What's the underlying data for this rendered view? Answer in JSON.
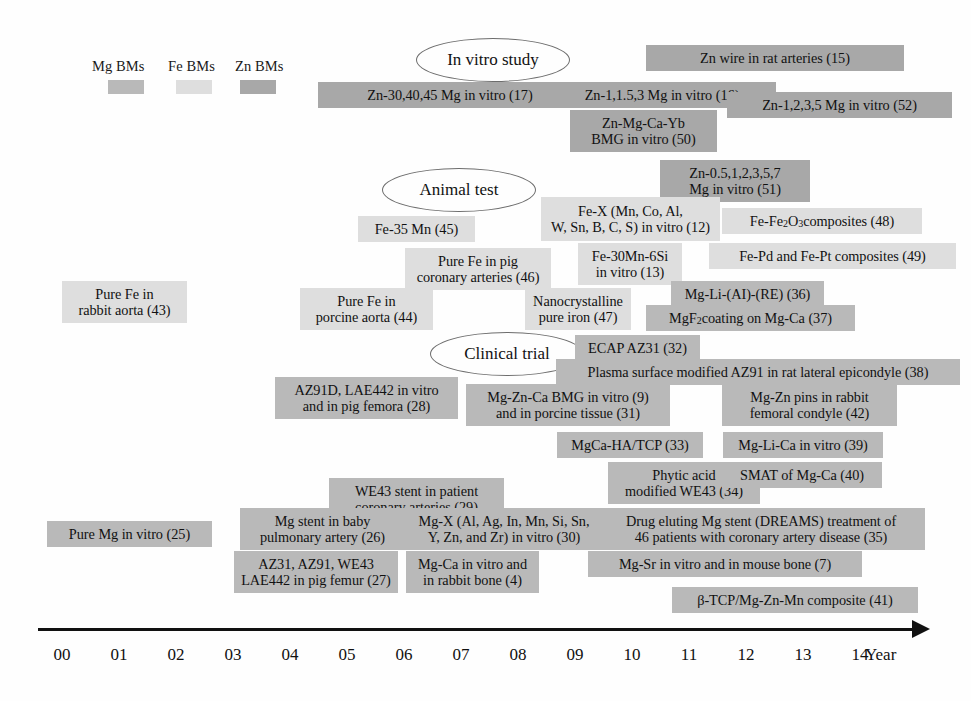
{
  "figure": {
    "type": "timeline",
    "title_present": false,
    "axis": {
      "label": "Year",
      "ticks": [
        "00",
        "01",
        "02",
        "03",
        "04",
        "05",
        "06",
        "07",
        "08",
        "09",
        "10",
        "11",
        "12",
        "13",
        "14"
      ],
      "x_positions": [
        62,
        119,
        176,
        233,
        290,
        347,
        404,
        461,
        518,
        575,
        632,
        689,
        746,
        803,
        860
      ]
    },
    "legend": {
      "items": [
        {
          "label": "Mg BMs",
          "color": "#b9b9b9",
          "key": "mg"
        },
        {
          "label": "Fe BMs",
          "color": "#dedede",
          "key": "fe"
        },
        {
          "label": "Zn BMs",
          "color": "#a8a8a8",
          "key": "zn"
        }
      ]
    },
    "categories": [
      {
        "label": "In vitro study",
        "x": 416,
        "y": 38,
        "w": 152,
        "h": 42
      },
      {
        "label": "Animal test",
        "x": 382,
        "y": 168,
        "w": 152,
        "h": 42
      },
      {
        "label": "Clinical trial",
        "x": 430,
        "y": 332,
        "w": 152,
        "h": 42
      }
    ],
    "events": [
      {
        "id": 15,
        "label": "Zn wire in rat arteries (15)",
        "group": "zn",
        "x": 646,
        "y": 45,
        "w": 258,
        "h": 26
      },
      {
        "id": 17,
        "label": "Zn-30,40,45 Mg in vitro (17)",
        "group": "zn",
        "x": 318,
        "y": 82,
        "w": 264,
        "h": 26
      },
      {
        "id": 16,
        "label": "Zn-1,1.5,3 Mg in vitro (16)",
        "group": "zn",
        "x": 548,
        "y": 82,
        "w": 228,
        "h": 26
      },
      {
        "id": 52,
        "label": "Zn-1,2,3,5 Mg in vitro (52)",
        "group": "zn",
        "x": 727,
        "y": 92,
        "w": 225,
        "h": 26
      },
      {
        "id": 50,
        "label": "Zn-Mg-Ca-Yb\nBMG in vitro (50)",
        "group": "zn",
        "x": 570,
        "y": 110,
        "w": 147,
        "h": 42
      },
      {
        "id": 51,
        "label": "Zn-0.5,1,2,3,5,7\nMg in vitro (51)",
        "group": "zn",
        "x": 660,
        "y": 160,
        "w": 150,
        "h": 42
      },
      {
        "id": 12,
        "label": "Fe-X (Mn, Co, Al,\nW, Sn, B, C, S) in vitro (12)",
        "group": "fe",
        "x": 541,
        "y": 197,
        "w": 179,
        "h": 44
      },
      {
        "id": 48,
        "label": "Fe-Fe2O3 composites (48)",
        "label_html": "Fe-Fe<sub>2</sub>O<sub>3</sub> composites (48)",
        "group": "fe",
        "x": 722,
        "y": 208,
        "w": 200,
        "h": 26
      },
      {
        "id": 45,
        "label": "Fe-35 Mn (45)",
        "group": "fe",
        "x": 358,
        "y": 216,
        "w": 117,
        "h": 26
      },
      {
        "id": 13,
        "label": "Fe-30Mn-6Si\nin vitro (13)",
        "group": "fe",
        "x": 578,
        "y": 243,
        "w": 104,
        "h": 42
      },
      {
        "id": 49,
        "label": "Fe-Pd and Fe-Pt composites (49)",
        "group": "fe",
        "x": 709,
        "y": 243,
        "w": 247,
        "h": 26
      },
      {
        "id": 46,
        "label": "Pure Fe in pig\ncoronary arteries (46)",
        "group": "fe",
        "x": 405,
        "y": 248,
        "w": 146,
        "h": 42
      },
      {
        "id": 43,
        "label": "Pure Fe in\nrabbit aorta (43)",
        "group": "fe",
        "x": 62,
        "y": 281,
        "w": 125,
        "h": 42
      },
      {
        "id": 36,
        "label": "Mg-Li-(AI)-(RE) (36)",
        "group": "mg",
        "x": 671,
        "y": 281,
        "w": 153,
        "h": 26
      },
      {
        "id": 44,
        "label": "Pure Fe in\nporcine aorta (44)",
        "group": "fe",
        "x": 300,
        "y": 288,
        "w": 133,
        "h": 42
      },
      {
        "id": 47,
        "label": "Nanocrystalline\npure iron (47)",
        "group": "fe",
        "x": 525,
        "y": 288,
        "w": 106,
        "h": 42
      },
      {
        "id": 37,
        "label": "MgF2 coating on Mg-Ca (37)",
        "label_html": "MgF<sub>2</sub> coating on Mg-Ca (37)",
        "group": "mg",
        "x": 646,
        "y": 305,
        "w": 209,
        "h": 26
      },
      {
        "id": 32,
        "label": "ECAP AZ31 (32)",
        "group": "mg",
        "x": 575,
        "y": 335,
        "w": 125,
        "h": 26
      },
      {
        "id": 38,
        "label": "Plasma surface modified AZ91 in rat lateral epicondyle (38)",
        "group": "mg",
        "x": 556,
        "y": 359,
        "w": 404,
        "h": 26
      },
      {
        "id": 28,
        "label": "AZ91D, LAE442 in vitro\nand in pig femora (28)",
        "group": "mg",
        "x": 275,
        "y": 377,
        "w": 183,
        "h": 42
      },
      {
        "id": 31,
        "label": "Mg-Zn-Ca BMG in vitro (9)\nand in porcine tissue (31)",
        "group": "mg",
        "x": 466,
        "y": 384,
        "w": 204,
        "h": 42
      },
      {
        "id": 42,
        "label": "Mg-Zn pins in rabbit\nfemoral condyle (42)",
        "group": "mg",
        "x": 722,
        "y": 384,
        "w": 175,
        "h": 42
      },
      {
        "id": 33,
        "label": "MgCa-HA/TCP (33)",
        "group": "mg",
        "x": 557,
        "y": 432,
        "w": 146,
        "h": 26
      },
      {
        "id": 39,
        "label": "Mg-Li-Ca in vitro (39)",
        "group": "mg",
        "x": 723,
        "y": 432,
        "w": 160,
        "h": 26
      },
      {
        "id": 34,
        "label": "Phytic acid\nmodified WE43 (34)",
        "group": "mg",
        "x": 608,
        "y": 462,
        "w": 152,
        "h": 42
      },
      {
        "id": 40,
        "label": "SMAT of Mg-Ca (40)",
        "group": "mg",
        "x": 722,
        "y": 462,
        "w": 160,
        "h": 26
      },
      {
        "id": 29,
        "label": "WE43 stent in patient\ncoronary arteries (29)",
        "group": "mg",
        "x": 329,
        "y": 478,
        "w": 175,
        "h": 42
      },
      {
        "id": 26,
        "label": "Mg stent in baby\npulmonary artery (26)",
        "group": "mg",
        "x": 240,
        "y": 508,
        "w": 165,
        "h": 42
      },
      {
        "id": 30,
        "label": "Mg-X (Al, Ag, In, Mn, Si, Sn,\nY, Zn, and Zr) in vitro (30)",
        "group": "mg",
        "x": 404,
        "y": 508,
        "w": 200,
        "h": 42
      },
      {
        "id": 35,
        "label": "Drug eluting Mg stent (DREAMS) treatment of\n46 patients with coronary artery disease (35)",
        "group": "mg",
        "x": 597,
        "y": 508,
        "w": 328,
        "h": 42
      },
      {
        "id": 25,
        "label": "Pure Mg in vitro (25)",
        "group": "mg",
        "x": 47,
        "y": 521,
        "w": 165,
        "h": 26
      },
      {
        "id": 27,
        "label": "AZ31, AZ91, WE43\nLAE442 in pig femur (27)",
        "group": "mg",
        "x": 234,
        "y": 551,
        "w": 164,
        "h": 42
      },
      {
        "id": 4,
        "label": "Mg-Ca in vitro and\nin rabbit bone (4)",
        "group": "mg",
        "x": 406,
        "y": 551,
        "w": 133,
        "h": 42
      },
      {
        "id": 7,
        "label": "Mg-Sr in vitro and in mouse bone (7)",
        "group": "mg",
        "x": 588,
        "y": 551,
        "w": 274,
        "h": 26
      },
      {
        "id": 41,
        "label": "β-TCP/Mg-Zn-Mn composite (41)",
        "group": "mg",
        "x": 672,
        "y": 587,
        "w": 246,
        "h": 26
      }
    ]
  }
}
